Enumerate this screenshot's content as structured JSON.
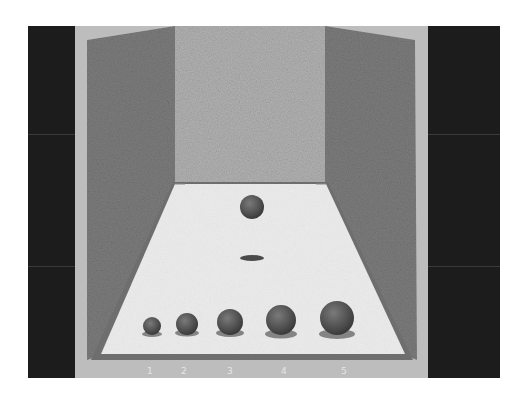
{
  "figure": {
    "colors": {
      "background": "#ffffff",
      "frame": "#b9b9b9",
      "side_bands": "#1c1c1c",
      "back_wall": "#b0b0b0",
      "side_walls": "#7d7d7d",
      "floor": "#ededed",
      "floor_border": "#6e6e6e",
      "sphere": "#5a5a5a"
    },
    "floor_spheres": [
      {
        "label": "1",
        "relative_size": 1
      },
      {
        "label": "2",
        "relative_size": 2
      },
      {
        "label": "3",
        "relative_size": 3
      },
      {
        "label": "4",
        "relative_size": 4
      },
      {
        "label": "5",
        "relative_size": 5
      }
    ],
    "floating_sphere": {
      "has_shadow": true
    },
    "labels": [
      "1",
      "2",
      "3",
      "4",
      "5"
    ]
  }
}
